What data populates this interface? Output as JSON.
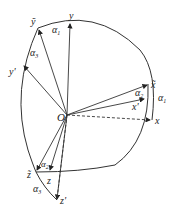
{
  "diagram": {
    "origin_label": "O",
    "axes": {
      "x": "x",
      "y": "y",
      "z": "z",
      "x_tilde": "x̃",
      "y_tilde": "ỹ",
      "z_tilde": "z̃",
      "x_prime": "x'",
      "y_prime": "y'",
      "z_prime": "z'"
    },
    "angles": {
      "alpha1": "α",
      "alpha1_sub": "1",
      "alpha2": "α",
      "alpha2_sub": "2",
      "alpha3": "α",
      "alpha3_sub": "3"
    }
  }
}
